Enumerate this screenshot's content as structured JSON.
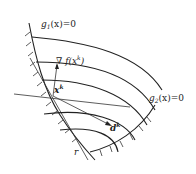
{
  "diagram": {
    "labels": {
      "g1": "g",
      "g1_sub": "1",
      "g1_rest": "(x)=0",
      "g2": "g",
      "g2_sub": "2",
      "g2_rest": "(x)=0",
      "grad": "∇ f(x",
      "grad_sup": "k",
      "grad_close": ")",
      "xk": "x",
      "xk_sup": "k",
      "dk": "d",
      "dk_sup": "k",
      "r": "r"
    }
  }
}
